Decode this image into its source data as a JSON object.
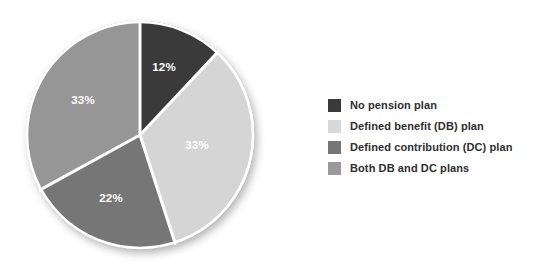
{
  "chart_data": {
    "type": "pie",
    "title": "",
    "subtitle": "",
    "xlabel": "",
    "ylabel": "",
    "grid": false,
    "legend_position": "right",
    "start_angle_deg": 0,
    "direction": "clockwise",
    "categories": [
      "No pension plan",
      "Defined benefit (DB) plan",
      "Defined contribution (DC) plan",
      "Both DB and DC plans"
    ],
    "values": [
      12,
      33,
      22,
      33
    ],
    "value_unit": "%",
    "slices": [
      {
        "label": "No pension plan",
        "value": 12,
        "data_label": "12%",
        "color": "#3a3a3a",
        "start_deg": 0,
        "end_deg": 43.2,
        "label_x": 164,
        "label_y": 68
      },
      {
        "label": "Defined benefit (DB) plan",
        "value": 33,
        "data_label": "33%",
        "color": "#d5d5d5",
        "start_deg": 43.2,
        "end_deg": 162.0,
        "label_x": 197,
        "label_y": 146
      },
      {
        "label": "Defined contribution (DC) plan",
        "value": 22,
        "data_label": "22%",
        "color": "#767676",
        "start_deg": 162.0,
        "end_deg": 241.2,
        "label_x": 111,
        "label_y": 199
      },
      {
        "label": "Both DB and DC plans",
        "value": 33,
        "data_label": "33%",
        "color": "#969696",
        "start_deg": 241.2,
        "end_deg": 360.0,
        "label_x": 83,
        "label_y": 101
      }
    ],
    "separator_color": "#ffffff",
    "data_label_color": "#ffffff",
    "background_color": "#ffffff"
  },
  "pie": {
    "center_x": 140,
    "center_y": 135,
    "radius": 114,
    "labels": {
      "slice_0": "12%",
      "slice_1": "33%",
      "slice_2": "22%",
      "slice_3": "33%"
    }
  },
  "legend": {
    "items": [
      {
        "label": "No pension plan",
        "color": "#3a3a3a"
      },
      {
        "label": "Defined benefit (DB) plan",
        "color": "#d8d8d8"
      },
      {
        "label": "Defined contribution (DC) plan",
        "color": "#767676"
      },
      {
        "label": "Both DB and DC plans",
        "color": "#9a9a9a"
      }
    ]
  }
}
